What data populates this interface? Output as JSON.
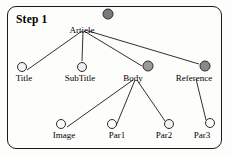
{
  "diagram": {
    "title": "Step 1",
    "type": "tree",
    "frame": {
      "shape": "rounded-rectangle",
      "border_color": "#1a1a1a",
      "background": "#fdfdfb"
    },
    "palette": {
      "node_stroke": "#2b2b2b",
      "edge_color": "#1a1a1a",
      "fill_empty": "#fbfbfb",
      "fill_light": "#e2e2e2",
      "fill_mid": "#9a9a9a",
      "fill_dark": "#7a7a7a"
    },
    "nodes": [
      {
        "id": "article",
        "label": "Article",
        "cx": 108,
        "cy": 14,
        "r": 5.5,
        "fill": "#7a7a7a",
        "label_x": 82,
        "label_y": 26
      },
      {
        "id": "title",
        "label": "Title",
        "cx": 22,
        "cy": 67,
        "r": 5.0,
        "fill": "#f2f2f2",
        "label_x": 24,
        "label_y": 74
      },
      {
        "id": "subtitle",
        "label": "SubTitle",
        "cx": 82,
        "cy": 67,
        "r": 5.0,
        "fill": "#eeeeee",
        "label_x": 80,
        "label_y": 74
      },
      {
        "id": "body",
        "label": "Body",
        "cx": 148,
        "cy": 66,
        "r": 5.5,
        "fill": "#9a9a9a",
        "label_x": 133,
        "label_y": 74
      },
      {
        "id": "reference",
        "label": "Reference",
        "cx": 205,
        "cy": 66,
        "r": 5.5,
        "fill": "#8a8a8a",
        "label_x": 194,
        "label_y": 74
      },
      {
        "id": "image",
        "label": "Image",
        "cx": 61,
        "cy": 124,
        "r": 5.0,
        "fill": "#fbfbfb",
        "label_x": 64,
        "label_y": 131
      },
      {
        "id": "par1",
        "label": "Par1",
        "cx": 112,
        "cy": 124,
        "r": 5.0,
        "fill": "#fbfbfb",
        "label_x": 117,
        "label_y": 131
      },
      {
        "id": "par2",
        "label": "Par2",
        "cx": 169,
        "cy": 124,
        "r": 5.0,
        "fill": "#f0f0f0",
        "label_x": 164,
        "label_y": 131
      },
      {
        "id": "par3",
        "label": "Par3",
        "cx": 210,
        "cy": 123,
        "r": 5.0,
        "fill": "#fbfbfb",
        "label_x": 202,
        "label_y": 131
      }
    ],
    "edges": [
      {
        "from": "article",
        "to": "title",
        "x1": 82,
        "y1": 31,
        "x2": 27,
        "y2": 70
      },
      {
        "from": "article",
        "to": "subtitle",
        "x1": 83,
        "y1": 31,
        "x2": 82,
        "y2": 61
      },
      {
        "from": "article",
        "to": "body",
        "x1": 84,
        "y1": 31,
        "x2": 142,
        "y2": 66
      },
      {
        "from": "article",
        "to": "reference",
        "x1": 85,
        "y1": 30,
        "x2": 199,
        "y2": 64
      },
      {
        "from": "body",
        "to": "image",
        "x1": 133,
        "y1": 80,
        "x2": 67,
        "y2": 127
      },
      {
        "from": "body",
        "to": "par1",
        "x1": 135,
        "y1": 80,
        "x2": 116,
        "y2": 126
      },
      {
        "from": "body",
        "to": "par2",
        "x1": 137,
        "y1": 80,
        "x2": 165,
        "y2": 121
      },
      {
        "from": "reference",
        "to": "par3",
        "x1": 196,
        "y1": 79,
        "x2": 206,
        "y2": 120
      }
    ]
  }
}
